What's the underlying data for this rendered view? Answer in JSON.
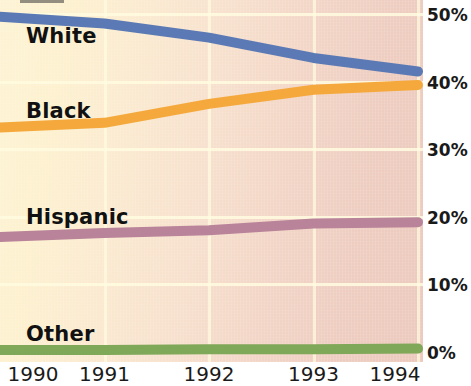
{
  "chart_data": {
    "type": "line",
    "title": "",
    "xlabel": "",
    "ylabel": "",
    "categories": [
      "1990",
      "1991",
      "1992",
      "1993",
      "1994"
    ],
    "x_tick_labels": [
      "1990",
      "1991",
      "1992",
      "1993",
      "1994"
    ],
    "y_tick_labels": [
      "50%",
      "40%",
      "30%",
      "20%",
      "10%",
      "0%"
    ],
    "y_tick_values": [
      50,
      40,
      30,
      20,
      10,
      0
    ],
    "ylim": [
      0,
      50
    ],
    "grid": true,
    "legend": "inline-series-labels",
    "series": [
      {
        "name": "White",
        "color": "#5b7ab5",
        "label": "White",
        "values": [
          49.6,
          48.6,
          46.5,
          43.5,
          41.5
        ]
      },
      {
        "name": "Black",
        "color": "#f5a93c",
        "label": "Black",
        "values": [
          33.2,
          33.9,
          36.7,
          38.8,
          39.5
        ]
      },
      {
        "name": "Hispanic",
        "color": "#b9839a",
        "label": "Hispanic",
        "values": [
          17.0,
          17.6,
          18.0,
          19.0,
          19.2
        ]
      },
      {
        "name": "Other",
        "color": "#7fa858",
        "label": "Other",
        "values": [
          0.3,
          0.3,
          0.4,
          0.4,
          0.5
        ]
      }
    ]
  },
  "axis": {
    "y_labels": [
      "50%",
      "40%",
      "30%",
      "20%",
      "10%",
      "0%"
    ],
    "x_labels": [
      "1990",
      "1991",
      "1992",
      "1993",
      "1994"
    ]
  },
  "colors": {
    "white_series": "#5b7ab5",
    "black_series": "#f5a93c",
    "hispanic_series": "#b9839a",
    "other_series": "#7fa858",
    "background_light": "#fdf3d4",
    "background_dark": "#ecc9bd",
    "gridline": "#fffce1",
    "text": "#1a1a1a"
  }
}
